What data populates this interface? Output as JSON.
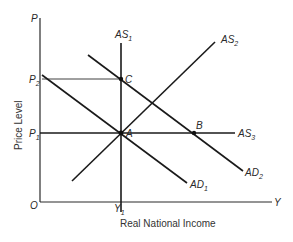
{
  "diagram": {
    "type": "AS-AD macroeconomic model",
    "axes": {
      "y_axis_label": "P",
      "x_axis_label": "Y",
      "origin_label": "O",
      "y_title": "Price Level",
      "x_title": "Real National Income"
    },
    "tick_labels": {
      "p1": {
        "base": "P",
        "sub": "1"
      },
      "p2": {
        "base": "P",
        "sub": "2"
      },
      "y1": {
        "base": "Y",
        "sub": "1"
      }
    },
    "curves": [
      {
        "id": "AS1",
        "base": "AS",
        "sub": "1",
        "kind": "vertical supply"
      },
      {
        "id": "AS2",
        "base": "AS",
        "sub": "2",
        "kind": "upward-sloping supply"
      },
      {
        "id": "AS3",
        "base": "AS",
        "sub": "3",
        "kind": "horizontal supply"
      },
      {
        "id": "AD1",
        "base": "AD",
        "sub": "1",
        "kind": "demand"
      },
      {
        "id": "AD2",
        "base": "AD",
        "sub": "2",
        "kind": "demand (shifted right)"
      }
    ],
    "points": [
      {
        "id": "A",
        "label": "A",
        "at": "P1,Y1"
      },
      {
        "id": "B",
        "label": "B",
        "at": "P1, AD2∩AS3"
      },
      {
        "id": "C",
        "label": "C",
        "at": "P2,Y1"
      }
    ],
    "colors": {
      "line": "#1a1a1a",
      "text": "#2a2a2a"
    }
  }
}
